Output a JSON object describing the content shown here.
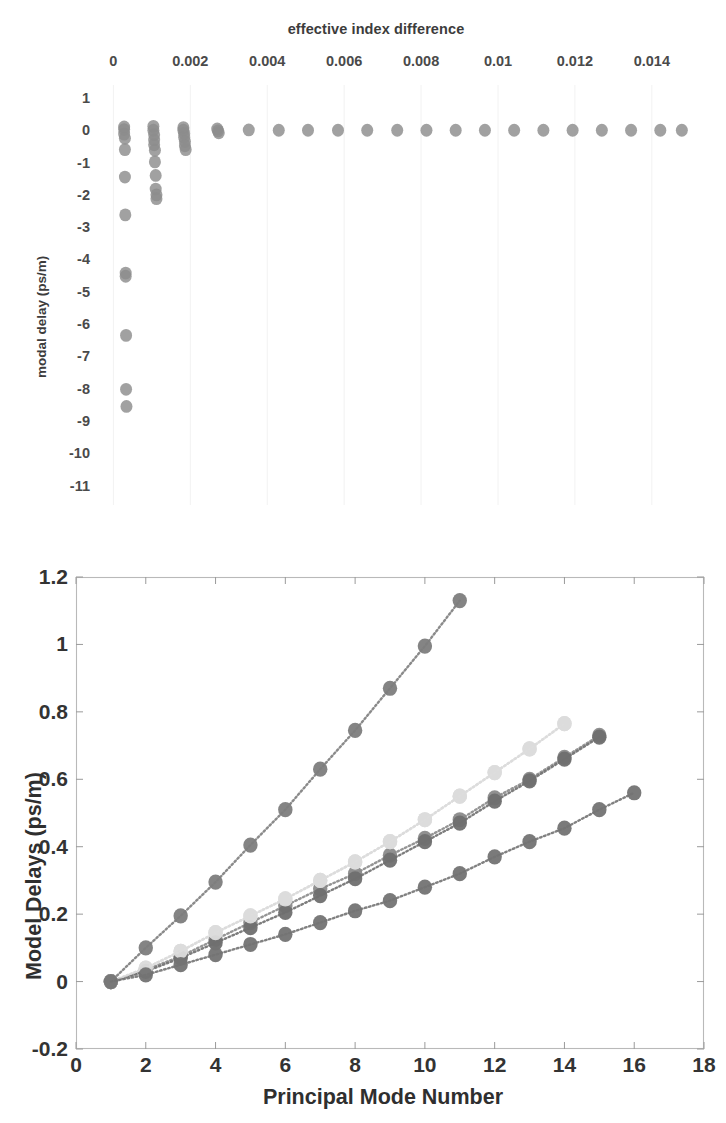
{
  "figure": {
    "background": "#ffffff"
  },
  "top_chart": {
    "title": "effective index difference",
    "ylabel": "modal delay (ps/m)",
    "xticks": [
      "0",
      "0.002",
      "0.004",
      "0.006",
      "0.008",
      "0.01",
      "0.012",
      "0.014"
    ],
    "yticks": [
      "1",
      "0",
      "-1",
      "-2",
      "-3",
      "-4",
      "-5",
      "-6",
      "-7",
      "-8",
      "-9",
      "-10",
      "-11"
    ],
    "marker_color": "#8c8c8c"
  },
  "bottom_chart": {
    "xlabel": "Principal Mode Number",
    "ylabel": "Model Delays (ps/m)",
    "xticks": [
      "0",
      "2",
      "4",
      "6",
      "8",
      "10",
      "12",
      "14",
      "16",
      "18"
    ],
    "yticks": [
      "-0.2",
      "0",
      "0.2",
      "0.4",
      "0.6",
      "0.8",
      "1",
      "1.2"
    ],
    "legend": [
      {
        "label": "850 nm",
        "color": "#7d7d7d",
        "marker": false
      },
      {
        "label": "990 nm",
        "color": "#8a8a8a",
        "marker": true
      },
      {
        "label": "1020nm",
        "color": "#d8d8d8",
        "marker": false
      },
      {
        "label": "1050nm",
        "color": "#6f6f6f",
        "marker": true
      },
      {
        "label": "1080nm",
        "color": "#dcdcdc",
        "marker": true
      },
      {
        "label": "1300 nm",
        "color": "#737373",
        "marker": true
      }
    ]
  },
  "chart_data": [
    {
      "type": "scatter",
      "id": "top",
      "title": "effective index difference",
      "xlabel": "effective index difference",
      "ylabel": "modal delay (ps/m)",
      "xlim": [
        -0.0004,
        0.0152
      ],
      "ylim": [
        -11.6,
        1.4
      ],
      "xticks": [
        0,
        0.002,
        0.004,
        0.006,
        0.008,
        0.01,
        0.012,
        0.014
      ],
      "yticks": [
        1,
        0,
        -1,
        -2,
        -3,
        -4,
        -5,
        -6,
        -7,
        -8,
        -9,
        -10,
        -11
      ],
      "grid": false,
      "legend": "none",
      "marker_color": "#8c8c8c",
      "points": [
        [
          0.00028,
          0.1
        ],
        [
          0.00028,
          0.02
        ],
        [
          0.00028,
          -0.12
        ],
        [
          0.0003,
          -0.25
        ],
        [
          0.0003,
          -0.6
        ],
        [
          0.0003,
          -1.45
        ],
        [
          0.00031,
          -2.62
        ],
        [
          0.00032,
          -4.42
        ],
        [
          0.00032,
          -4.52
        ],
        [
          0.00033,
          -6.35
        ],
        [
          0.00033,
          -8.02
        ],
        [
          0.00034,
          -8.55
        ],
        [
          0.00104,
          0.12
        ],
        [
          0.00104,
          0.0
        ],
        [
          0.00106,
          -0.14
        ],
        [
          0.00106,
          -0.3
        ],
        [
          0.00106,
          -0.45
        ],
        [
          0.00108,
          -0.62
        ],
        [
          0.00108,
          -0.98
        ],
        [
          0.0011,
          -1.4
        ],
        [
          0.0011,
          -1.82
        ],
        [
          0.00112,
          -2.0
        ],
        [
          0.00112,
          -2.12
        ],
        [
          0.00182,
          0.08
        ],
        [
          0.00182,
          0.0
        ],
        [
          0.00184,
          -0.1
        ],
        [
          0.00184,
          -0.22
        ],
        [
          0.00186,
          -0.35
        ],
        [
          0.00186,
          -0.48
        ],
        [
          0.00188,
          -0.6
        ],
        [
          0.0027,
          0.04
        ],
        [
          0.00272,
          -0.02
        ],
        [
          0.00274,
          -0.08
        ],
        [
          0.00352,
          0.01
        ],
        [
          0.0043,
          0.0
        ],
        [
          0.00506,
          0.0
        ],
        [
          0.00584,
          0.0
        ],
        [
          0.0066,
          0.0
        ],
        [
          0.00738,
          0.0
        ],
        [
          0.00814,
          0.0
        ],
        [
          0.0089,
          0.0
        ],
        [
          0.00966,
          0.0
        ],
        [
          0.01042,
          0.0
        ],
        [
          0.01118,
          0.0
        ],
        [
          0.01194,
          0.0
        ],
        [
          0.0127,
          0.0
        ],
        [
          0.01346,
          0.0
        ],
        [
          0.01422,
          0.0
        ],
        [
          0.01478,
          0.0
        ]
      ]
    },
    {
      "type": "line",
      "id": "bottom",
      "title": "",
      "xlabel": "Principal Mode Number",
      "ylabel": "Model Delays (ps/m)",
      "xlim": [
        0,
        18
      ],
      "ylim": [
        -0.2,
        1.2
      ],
      "xticks": [
        0,
        2,
        4,
        6,
        8,
        10,
        12,
        14,
        16,
        18
      ],
      "yticks": [
        -0.2,
        0,
        0.2,
        0.4,
        0.6,
        0.8,
        1,
        1.2
      ],
      "grid": false,
      "legend_position": "upper-left",
      "linestyle": "dotted",
      "marker": "circle",
      "series": [
        {
          "name": "850 nm",
          "color": "#7d7d7d",
          "x": [
            1,
            2,
            3,
            4,
            5,
            6,
            7,
            8,
            9,
            10,
            11
          ],
          "values": [
            0.0,
            0.1,
            0.195,
            0.295,
            0.405,
            0.51,
            0.63,
            0.745,
            0.87,
            0.995,
            1.13
          ]
        },
        {
          "name": "990 nm",
          "color": "#8a8a8a",
          "x": [
            1,
            2,
            3,
            4,
            5,
            6,
            7,
            8,
            9,
            10,
            11,
            12,
            13,
            14,
            15
          ],
          "values": [
            0.0,
            0.035,
            0.075,
            0.125,
            0.175,
            0.225,
            0.275,
            0.32,
            0.375,
            0.425,
            0.48,
            0.545,
            0.6,
            0.665,
            0.73
          ]
        },
        {
          "name": "1020nm",
          "color": "#d8d8d8",
          "x": [
            1,
            2,
            3,
            4,
            5,
            6,
            7,
            8,
            9,
            10,
            11,
            12,
            13,
            14
          ],
          "values": [
            0.0,
            0.04,
            0.09,
            0.145,
            0.195,
            0.245,
            0.3,
            0.355,
            0.415,
            0.48,
            0.55,
            0.62,
            0.69,
            0.765
          ]
        },
        {
          "name": "1050nm",
          "color": "#6f6f6f",
          "x": [
            1,
            2,
            3,
            4,
            5,
            6,
            7,
            8,
            9,
            10,
            11,
            12,
            13,
            14,
            15
          ],
          "values": [
            0.0,
            0.03,
            0.07,
            0.115,
            0.16,
            0.205,
            0.255,
            0.305,
            0.36,
            0.415,
            0.47,
            0.535,
            0.595,
            0.66,
            0.725
          ]
        },
        {
          "name": "1080nm",
          "color": "#dcdcdc",
          "x": [
            1,
            2,
            3,
            4,
            5,
            6,
            7,
            8,
            9,
            10,
            11,
            12,
            13,
            14
          ],
          "values": [
            0.0,
            0.04,
            0.09,
            0.145,
            0.195,
            0.245,
            0.3,
            0.355,
            0.415,
            0.48,
            0.55,
            0.62,
            0.69,
            0.765
          ]
        },
        {
          "name": "1300 nm",
          "color": "#737373",
          "x": [
            1,
            2,
            3,
            4,
            5,
            6,
            7,
            8,
            9,
            10,
            11,
            12,
            13,
            14,
            15,
            16
          ],
          "values": [
            0.0,
            0.02,
            0.05,
            0.08,
            0.11,
            0.14,
            0.175,
            0.21,
            0.24,
            0.28,
            0.32,
            0.37,
            0.415,
            0.455,
            0.51,
            0.56
          ]
        }
      ]
    }
  ]
}
